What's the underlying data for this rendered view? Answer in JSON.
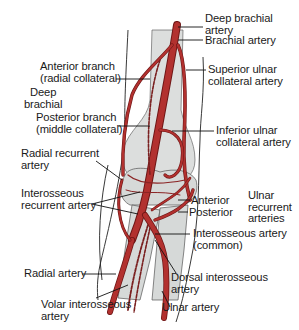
{
  "diagram": {
    "colors": {
      "artery": "#b2312f",
      "artery_outline": "#6e1616",
      "bone": "#dcdedd",
      "bone_outline": "#555555",
      "leader_line": "#111111",
      "text": "#1a1a1a"
    },
    "labels": {
      "deep_brachial_artery_l1": "Deep brachial",
      "deep_brachial_artery_l2": "artery",
      "brachial_artery": "Brachial artery",
      "anterior_branch_l1": "Anterior branch",
      "anterior_branch_l2": "(radial collateral)",
      "deep_brachial_group_l1": "Deep",
      "deep_brachial_group_l2": "brachial",
      "superior_ulnar_l1": "Superior ulnar",
      "superior_ulnar_l2": "collateral artery",
      "posterior_branch_l1": "Posterior branch",
      "posterior_branch_l2": "(middle collateral)",
      "inferior_ulnar_l1": "Inferior ulnar",
      "inferior_ulnar_l2": "collateral artery",
      "radial_recurrent_l1": "Radial recurrent",
      "radial_recurrent_l2": "artery",
      "interosseous_recurrent_l1": "Interosseous",
      "interosseous_recurrent_l2": "recurrent artery",
      "anterior": "Anterior",
      "posterior": "Posterior",
      "ulnar_recurrent_l1": "Ulnar",
      "ulnar_recurrent_l2": "recurrent",
      "ulnar_recurrent_l3": "arteries",
      "interosseous_common_l1": "Interosseous artery",
      "interosseous_common_l2": "(common)",
      "radial_artery": "Radial artery",
      "dorsal_interosseous_l1": "Dorsal interosseous",
      "dorsal_interosseous_l2": "artery",
      "volar_interosseous_l1": "Volar interosseous",
      "volar_interosseous_l2": "artery",
      "ulnar_artery": "Ulnar artery"
    }
  }
}
